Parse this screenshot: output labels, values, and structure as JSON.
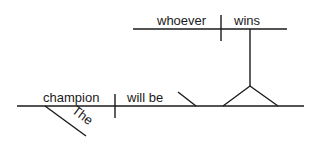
{
  "diagram": {
    "type": "sentence-diagram",
    "sentence": "The champion will be whoever wins",
    "main_line": {
      "subject": "champion",
      "verb": "will be",
      "subject_modifier": "The"
    },
    "pedestal_clause": {
      "subject": "whoever",
      "verb": "wins"
    },
    "colors": {
      "line": "#1a1a1a",
      "background": "#ffffff"
    }
  }
}
